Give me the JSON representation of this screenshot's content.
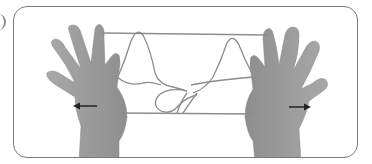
{
  "figure": {
    "label_partial": ")",
    "arrows": [
      {
        "direction": "left",
        "side": "left-hand"
      },
      {
        "direction": "right",
        "side": "right-hand"
      }
    ],
    "colors": {
      "frame": "#7a7a7a",
      "hand": "#9a9a9a",
      "hand_shadow": "#7c7c7c",
      "string": "#8c8c8c",
      "arrow": "#222222",
      "background": "#ffffff"
    }
  }
}
